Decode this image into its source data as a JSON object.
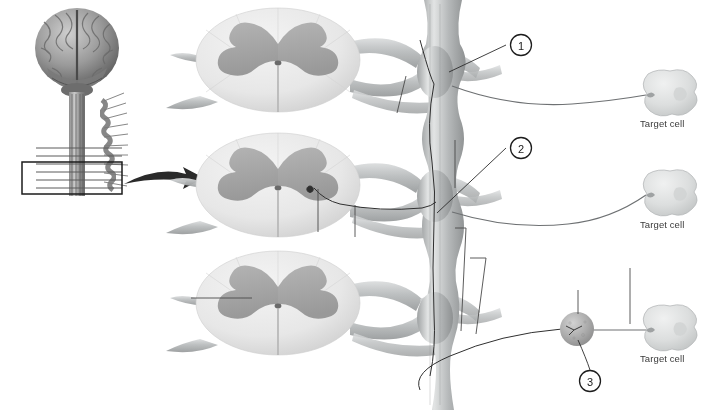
{
  "figure": {
    "background_color": "#ffffff",
    "ink_color": "#3a3a3a",
    "gray_matter_color": "#a8a8a8",
    "white_matter_color": "#e9e9e9",
    "nerve_color": "#b9bcbd",
    "ganglion_color": "#a9a9a9"
  },
  "inset": {
    "name": "brain-and-spinal-cord-inset",
    "brain_label": "brain",
    "spinal_cord_label": "spinal cord",
    "highlight_box_label": "region of interest box",
    "arrow_label": "magnification arrow"
  },
  "callouts": [
    {
      "number": "1",
      "cx": 521,
      "cy": 45,
      "leader_to_x": 449,
      "leader_to_y": 72
    },
    {
      "number": "2",
      "cx": 521,
      "cy": 148,
      "leader_to_x": 437,
      "leader_to_y": 213
    },
    {
      "number": "3",
      "cx": 590,
      "cy": 381,
      "leader_to_x": 578,
      "leader_to_y": 333
    }
  ],
  "target_cells": [
    {
      "label": "Target cell",
      "cx": 670,
      "cy": 95,
      "label_x": 640,
      "label_y": 124
    },
    {
      "label": "Target cell",
      "cx": 670,
      "cy": 195,
      "label_x": 640,
      "label_y": 225
    },
    {
      "label": "Target cell",
      "cx": 670,
      "cy": 330,
      "label_x": 640,
      "label_y": 359
    }
  ],
  "spinal_sections": [
    {
      "name": "spinal-cord-section-top",
      "cx": 278,
      "cy": 60
    },
    {
      "name": "spinal-cord-section-middle",
      "cx": 278,
      "cy": 185
    },
    {
      "name": "spinal-cord-section-bottom",
      "cx": 278,
      "cy": 303
    }
  ],
  "chain_ganglia": [
    {
      "name": "sympathetic-chain-ganglion-top",
      "cx": 435,
      "cy": 72
    },
    {
      "name": "sympathetic-chain-ganglion-middle",
      "cx": 435,
      "cy": 196
    },
    {
      "name": "sympathetic-chain-ganglion-bottom",
      "cx": 435,
      "cy": 318
    }
  ],
  "blank_leader_lines": [
    {
      "name": "blank-answer-line-1",
      "d": "M 397 113 L 406 76"
    },
    {
      "name": "blank-answer-line-2",
      "d": "M 455 140 L 455 188"
    },
    {
      "name": "blank-answer-line-3",
      "d": "M 355 237 L 355 205"
    },
    {
      "name": "blank-answer-line-4",
      "d": "M 191 298 L 252 298"
    },
    {
      "name": "blank-answer-line-5",
      "d": "M 455 228 L 466 228 L 461 331"
    },
    {
      "name": "blank-answer-line-6",
      "d": "M 470 258 L 486 258 L 475 334"
    },
    {
      "name": "blank-answer-line-7",
      "d": "M 578 290 L 578 314"
    },
    {
      "name": "blank-answer-line-8",
      "d": "M 630 268 L 630 324"
    },
    {
      "name": "blank-answer-line-9",
      "d": "M 318 189 L 318 232"
    }
  ]
}
